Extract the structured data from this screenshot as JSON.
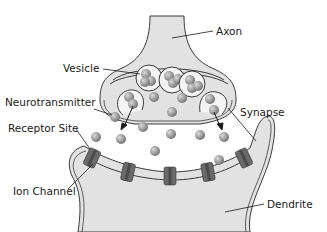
{
  "diagram": {
    "labels": {
      "axon": "Axon",
      "vesicle": "Vesicle",
      "neurotransmitter": "Neurotransmitter",
      "synapse": "Synapse",
      "receptor_site": "Receptor Site",
      "ion_channel": "Ion Channel",
      "dendrite": "Dendrite"
    },
    "colors": {
      "tissue_fill": "#e2e2e2",
      "outline": "#3a3a3a",
      "channel_dark": "#5e5e5e",
      "channel_light": "#8a8a8a",
      "ball": "#9a9a9a"
    }
  }
}
